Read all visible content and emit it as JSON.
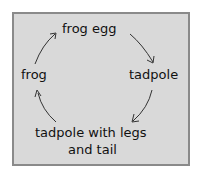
{
  "diagram": {
    "type": "cycle",
    "title": "",
    "stages": [
      {
        "id": "frog_egg",
        "label": "frog egg"
      },
      {
        "id": "tadpole",
        "label": "tadpole"
      },
      {
        "id": "tadpole_legs_tail",
        "label_line1": "tadpole with legs",
        "label_line2": "and tail"
      },
      {
        "id": "frog",
        "label": "frog"
      }
    ],
    "arrows": [
      {
        "from": "frog_egg",
        "to": "tadpole"
      },
      {
        "from": "tadpole",
        "to": "tadpole_legs_tail"
      },
      {
        "from": "tadpole_legs_tail",
        "to": "frog"
      },
      {
        "from": "frog",
        "to": "frog_egg"
      }
    ],
    "colors": {
      "background": "#d9d9d9",
      "border": "#8a8a8a",
      "text": "#111111"
    }
  }
}
